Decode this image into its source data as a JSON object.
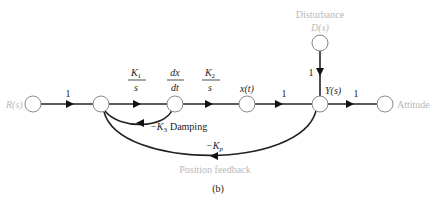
{
  "diagram": {
    "type": "signal-flow-graph",
    "caption": "(b)",
    "nodes": {
      "input": {
        "label": "R(s)"
      },
      "n2": {
        "label": ""
      },
      "n3": {
        "label": ""
      },
      "n4": {
        "label": "x(t)"
      },
      "output_node": {
        "label": "Y(s)"
      },
      "attitude": {
        "label": "Attitude"
      },
      "disturbance": {
        "label_line1": "Disturbance",
        "label_line2": "D(s)"
      }
    },
    "branches": {
      "r_to_n2": "1",
      "n2_to_n3_num": "K",
      "n2_to_n3_sub": "1",
      "n2_to_n3_den": "s",
      "n3_label_num": "dx",
      "n3_label_den": "dt",
      "n3_to_n4_num": "K",
      "n3_to_n4_sub": "2",
      "n3_to_n4_den": "s",
      "n4_to_y": "1",
      "y_to_attitude": "1",
      "d_to_y": "1",
      "damping_prefix": "−K",
      "damping_sub": "3",
      "damping_text": "Damping",
      "position_prefix": "−K",
      "position_sub": "p",
      "position_text": "Position feedback"
    }
  }
}
